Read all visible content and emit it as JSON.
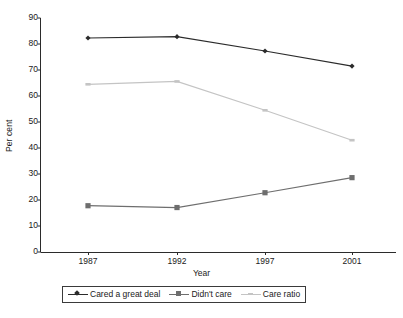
{
  "chart_data": {
    "type": "line",
    "title": "",
    "subtitle": "",
    "xlabel": "Year",
    "ylabel": "Per cent",
    "categories": [
      "1987",
      "1992",
      "1997",
      "2001"
    ],
    "x": [
      1987,
      1992,
      1997,
      2001
    ],
    "ylim": [
      0,
      90
    ],
    "ytick_step": 10,
    "yticks": [
      "90",
      "80",
      "70",
      "60",
      "50",
      "40",
      "30",
      "20",
      "10",
      "0"
    ],
    "grid": false,
    "legend_position": "bottom",
    "series": [
      {
        "name": "Cared a great deal",
        "marker": "diamond",
        "color": "#2b2b2b",
        "values": [
          82.3,
          82.8,
          77.3,
          71.5
        ]
      },
      {
        "name": "Didn't care",
        "marker": "square",
        "color": "#6e6e6e",
        "values": [
          17.8,
          17.1,
          22.8,
          28.6
        ]
      },
      {
        "name": "Care ratio",
        "marker": "dash",
        "color": "#c4c4c4",
        "values": [
          64.5,
          65.6,
          54.5,
          43.0
        ]
      }
    ]
  },
  "axes": {
    "y_tick_0": "90",
    "y_tick_1": "80",
    "y_tick_2": "70",
    "y_tick_3": "60",
    "y_tick_4": "50",
    "y_tick_5": "40",
    "y_tick_6": "30",
    "y_tick_7": "20",
    "y_tick_8": "10",
    "y_tick_9": "0",
    "x_tick_0": "1987",
    "x_tick_1": "1992",
    "x_tick_2": "1997",
    "x_tick_3": "2001",
    "x_axis_title": "Year",
    "y_axis_title": "Per cent"
  },
  "legend": {
    "item_0": "Cared a great deal",
    "item_1": "Didn't care",
    "item_2": "Care ratio"
  },
  "colors": {
    "series_cared": "#2b2b2b",
    "series_didnt_care": "#6e6e6e",
    "series_care_ratio": "#c4c4c4",
    "axis": "#2b2b2b",
    "background": "#ffffff"
  }
}
